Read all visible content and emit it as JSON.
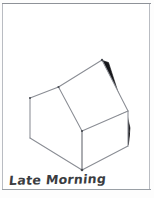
{
  "sketch": {
    "caption": "Late Morning",
    "subject": "house",
    "medium": "pencil sketch",
    "line_color": "#8a8d94",
    "shadow_color": "#16161a",
    "paper_color": "#ffffff",
    "frame_color": "#b9bcc2"
  },
  "geometry": {
    "ridge_peak": [
      102,
      60
    ],
    "left_gable_apex": [
      58,
      87
    ],
    "left_eave": [
      30,
      98
    ],
    "left_wall_bottom": [
      30,
      138
    ],
    "front_corner_top": [
      82,
      131
    ],
    "front_corner_bottom": [
      82,
      170
    ],
    "right_eave_top": [
      128,
      111
    ],
    "right_wall_bottom": [
      128,
      146
    ],
    "front_wall_bottom_left": [
      30,
      138
    ],
    "shadow_from": [
      102,
      60
    ],
    "shadow_to": [
      128,
      143
    ]
  },
  "labels": {
    "front_roof_panel": "front roof panel",
    "back_roof_panel": "back roof panel",
    "left_wall": "left wall",
    "right_wall": "right wall",
    "shadow": "cast shadow"
  }
}
